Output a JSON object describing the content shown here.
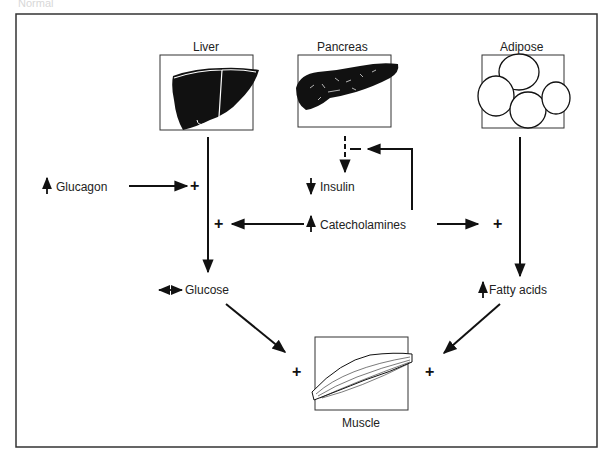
{
  "caption": "Normal",
  "organs": {
    "liver": {
      "label": "Liver",
      "icon": "liver-icon"
    },
    "pancreas": {
      "label": "Pancreas",
      "icon": "pancreas-icon"
    },
    "adipose": {
      "label": "Adipose",
      "icon": "adipose-cells-icon"
    },
    "muscle": {
      "label": "Muscle",
      "icon": "muscle-icon"
    }
  },
  "hormones": {
    "glucagon": {
      "label": "Glucagon",
      "trend": "up",
      "trend_icon": "up-arrow-icon"
    },
    "insulin": {
      "label": "Insulin",
      "trend": "down",
      "trend_icon": "down-arrow-icon"
    },
    "catecholamines": {
      "label": "Catecholamines",
      "trend": "up",
      "trend_icon": "up-arrow-icon"
    }
  },
  "substrates": {
    "glucose": {
      "label": "Glucose",
      "trend": "unchanged",
      "trend_icon": "double-arrow-icon"
    },
    "fatty_acids": {
      "label": "Fatty acids",
      "trend": "up",
      "trend_icon": "up-arrow-icon"
    }
  },
  "signs": {
    "stimulate": "+",
    "inhibit": "–"
  },
  "edges": [
    {
      "from": "Liver",
      "to": "Glucose",
      "type": "flow"
    },
    {
      "from": "Glucagon",
      "to": "Liver output",
      "sign": "+"
    },
    {
      "from": "Catecholamines",
      "to": "Liver output",
      "sign": "+"
    },
    {
      "from": "Catecholamines",
      "to": "Adipose output",
      "sign": "+"
    },
    {
      "from": "Catecholamines",
      "to": "Pancreas insulin release",
      "sign": "–"
    },
    {
      "from": "Pancreas",
      "to": "Insulin",
      "type": "dashed flow"
    },
    {
      "from": "Adipose",
      "to": "Fatty acids",
      "type": "flow"
    },
    {
      "from": "Glucose",
      "to": "Muscle",
      "sign": "+"
    },
    {
      "from": "Fatty acids",
      "to": "Muscle",
      "sign": "+"
    }
  ]
}
